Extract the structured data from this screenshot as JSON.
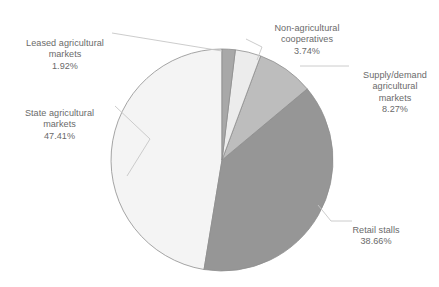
{
  "chart_data": {
    "type": "pie",
    "title": "",
    "subtitle": "",
    "xlabel": "",
    "ylabel": "",
    "grid": false,
    "legend_position": "none",
    "label_format": "name + percent",
    "start_angle_deg": 0,
    "direction": "clockwise",
    "units": "percent",
    "total": 100.0,
    "categories": [
      "Leased agricultural markets",
      "Non-agricultural cooperatives",
      "Supply/demand agricultural markets",
      "Retail stalls",
      "State agricultural markets"
    ],
    "values": [
      1.92,
      3.74,
      8.27,
      38.66,
      47.41
    ],
    "slices": [
      {
        "name": "Leased agricultural markets",
        "label_line1": "Leased agricultural",
        "label_line2": "markets",
        "percent": "1.92%",
        "value": 1.92,
        "color": "#a8a8a8",
        "label_position": "top-left"
      },
      {
        "name": "Non-agricultural cooperatives",
        "label_line1": "Non-agricultural",
        "label_line2": "cooperatives",
        "percent": "3.74%",
        "value": 3.74,
        "color": "#ececec",
        "label_position": "top-center"
      },
      {
        "name": "Supply/demand agricultural markets",
        "label_line1": "Supply/demand",
        "label_line2": "agricultural",
        "label_line3": "markets",
        "percent": "8.27%",
        "value": 8.27,
        "color": "#bdbdbd",
        "label_position": "right-top"
      },
      {
        "name": "Retail stalls",
        "label_line1": "Retail stalls",
        "percent": "38.66%",
        "value": 38.66,
        "color": "#969696",
        "label_position": "right-bottom"
      },
      {
        "name": "State agricultural markets",
        "label_line1": "State agricultural",
        "label_line2": "markets",
        "percent": "47.41%",
        "value": 47.41,
        "color": "#f4f4f4",
        "label_position": "left"
      }
    ],
    "colors": {
      "slice_border": "#8e8e8e",
      "leader_line": "#bfbfbf",
      "label_text": "#6a6a6a",
      "background": "#ffffff"
    }
  }
}
